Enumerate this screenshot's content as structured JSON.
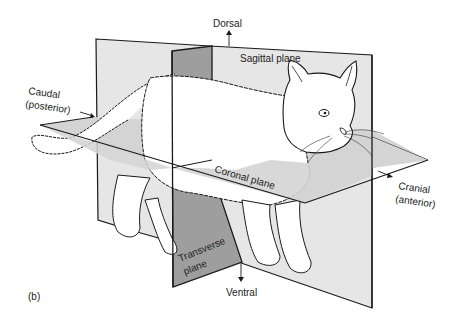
{
  "figure": {
    "panel_label": "(b)",
    "colors": {
      "background": "#ffffff",
      "sagittal_plane_fill": "#e6e6e6",
      "transverse_plane_fill": "#9e9e9e",
      "coronal_plane_fill": "#d4d4d4",
      "line": "#1a1a1a"
    },
    "planes": {
      "sagittal": "Sagittal plane",
      "coronal": "Coronal plane",
      "transverse_line1": "Transverse",
      "transverse_line2": "plane"
    },
    "directions": {
      "dorsal": "Dorsal",
      "ventral": "Ventral",
      "caudal_line1": "Caudal",
      "caudal_line2": "(posterior)",
      "cranial_line1": "Cranial",
      "cranial_line2": "(anterior)"
    }
  }
}
